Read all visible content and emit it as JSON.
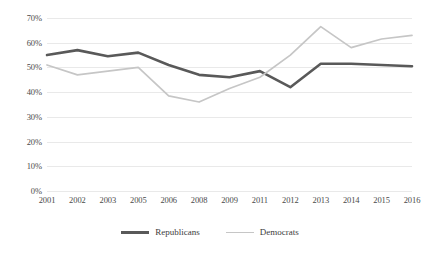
{
  "chart_data": {
    "type": "line",
    "title": "",
    "xlabel": "",
    "ylabel": "",
    "ylim": [
      0,
      70
    ],
    "ytick_step": 10,
    "ytick_suffix": "%",
    "grid": true,
    "legend_position": "bottom-center",
    "categories": [
      "2001",
      "2002",
      "2003",
      "2005",
      "2006",
      "2008",
      "2009",
      "2011",
      "2012",
      "2013",
      "2014",
      "2015",
      "2016"
    ],
    "yticks": [
      "0%",
      "10%",
      "20%",
      "30%",
      "40%",
      "50%",
      "60%",
      "70%"
    ],
    "ytick_values": [
      0,
      10,
      20,
      30,
      40,
      50,
      60,
      70
    ],
    "series": [
      {
        "name": "Republicans",
        "color": "#595959",
        "width": 2.6,
        "values": [
          55,
          57,
          54.5,
          56,
          51,
          47,
          46,
          48.5,
          42,
          51.5,
          51.5,
          51,
          50.5
        ]
      },
      {
        "name": "Democrats",
        "color": "#c6c6c6",
        "width": 1.7,
        "values": [
          51,
          47,
          48.5,
          50,
          38.5,
          36,
          41.5,
          46,
          55,
          66.5,
          58,
          61.5,
          63
        ]
      }
    ]
  },
  "legend": {
    "items": [
      {
        "label": "Republicans"
      },
      {
        "label": "Democrats"
      }
    ]
  }
}
